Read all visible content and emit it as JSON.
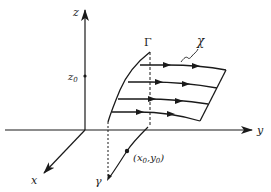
{
  "diagram": {
    "colors": {
      "ink": "#1a1a1a",
      "background": "#ffffff"
    },
    "axes": {
      "x": {
        "label": "x"
      },
      "y": {
        "label": "y"
      },
      "z": {
        "label": "z",
        "tick_label": "z",
        "tick_subscript": "0"
      }
    },
    "curves": {
      "initial_curve_label": "Γ",
      "characteristic_label": "χ",
      "projection_label": "γ"
    },
    "point": {
      "label_open": "(",
      "x": "x",
      "x_sub": "0",
      "comma": ",",
      "y": "y",
      "y_sub": "0",
      "label_close": ")"
    }
  }
}
